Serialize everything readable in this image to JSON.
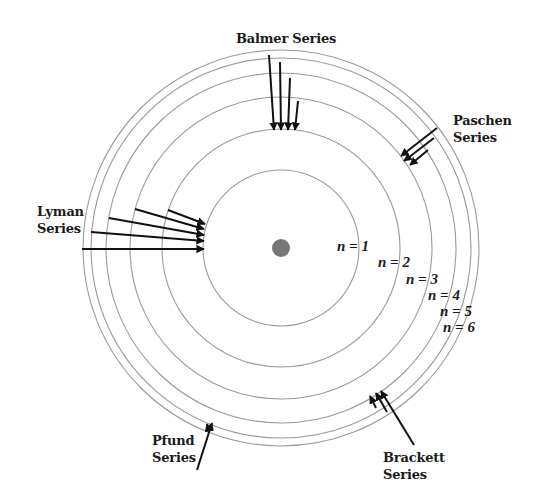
{
  "nucleus": {
    "cx": 281,
    "cy": 248,
    "r": 9,
    "color": "#777777"
  },
  "orbits": [
    {
      "n": 1,
      "r": 78,
      "label": "n = 1",
      "label_x": 337,
      "label_y": 238
    },
    {
      "n": 2,
      "r": 119,
      "label": "n = 2",
      "label_x": 378,
      "label_y": 254
    },
    {
      "n": 3,
      "r": 151,
      "label": "n = 3",
      "label_x": 406,
      "label_y": 271
    },
    {
      "n": 4,
      "r": 175,
      "label": "n = 4",
      "label_x": 428,
      "label_y": 287
    },
    {
      "n": 5,
      "r": 190,
      "label": "n = 5",
      "label_x": 440,
      "label_y": 303
    },
    {
      "n": 6,
      "r": 198,
      "label": "n = 6",
      "label_x": 443,
      "label_y": 319
    }
  ],
  "orbit_color": "#9a9a9a",
  "arrow_color": "#111111",
  "series": [
    {
      "name": "Balmer Series",
      "label_lines": [
        "Balmer Series"
      ],
      "label_x": 236,
      "label_y": 30,
      "arrows": [
        [
          269,
          55,
          274,
          130
        ],
        [
          280,
          62,
          281,
          130
        ],
        [
          290,
          78,
          288,
          130
        ],
        [
          298,
          101,
          295,
          130
        ]
      ]
    },
    {
      "name": "Paschen Series",
      "label_lines": [
        "Paschen",
        "Series"
      ],
      "label_x": 453,
      "label_y": 112,
      "arrows": [
        [
          437,
          128,
          401,
          156
        ],
        [
          434,
          138,
          404,
          161
        ],
        [
          428,
          150,
          410,
          165
        ]
      ]
    },
    {
      "name": "Lyman Series",
      "label_lines": [
        "Lyman",
        "Series"
      ],
      "label_x": 37,
      "label_y": 203,
      "arrows": [
        [
          82,
          249,
          204,
          249
        ],
        [
          91,
          232,
          204,
          241
        ],
        [
          109,
          218,
          204,
          235
        ],
        [
          135,
          209,
          204,
          229
        ],
        [
          168,
          210,
          205,
          224
        ]
      ]
    },
    {
      "name": "Brackett Series",
      "label_lines": [
        "Brackett",
        "Series"
      ],
      "label_x": 383,
      "label_y": 449,
      "arrows": [
        [
          414,
          445,
          381,
          391
        ],
        [
          387,
          412,
          376,
          393
        ],
        [
          376,
          408,
          370,
          396
        ]
      ]
    },
    {
      "name": "Pfund Series",
      "label_lines": [
        "Pfund",
        "Series"
      ],
      "label_x": 152,
      "label_y": 432,
      "arrows": [
        [
          197,
          470,
          212,
          423
        ],
        [
          209,
          432,
          207,
          424
        ]
      ]
    }
  ]
}
